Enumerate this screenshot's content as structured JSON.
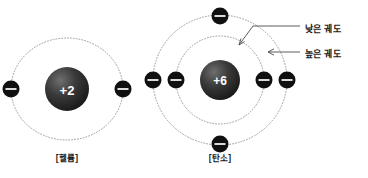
{
  "figure": {
    "background_color": "#ffffff",
    "orbit_color": "#9a9a9a",
    "electron_color": "#101010",
    "nucleus_color": "#2b2b2b",
    "text_color": "#1a1a1a"
  },
  "atoms": [
    {
      "id": "helium",
      "caption": "[헬륨]",
      "nucleus_label": "+2",
      "nucleus_cx": 67,
      "nucleus_cy": 89,
      "nucleus_r": 22,
      "shells": [
        {
          "name": "shell-1",
          "rx": 56,
          "ry": 51
        }
      ],
      "electrons": [
        {
          "cx": 11,
          "cy": 89
        },
        {
          "cx": 123,
          "cy": 89
        }
      ]
    },
    {
      "id": "carbon",
      "caption": "[탄소]",
      "nucleus_label": "+6",
      "nucleus_cx": 220,
      "nucleus_cy": 80,
      "nucleus_r": 20,
      "shells": [
        {
          "name": "inner-shell",
          "rx": 44,
          "ry": 44
        },
        {
          "name": "outer-shell",
          "rx": 67,
          "ry": 65
        }
      ],
      "electrons": [
        {
          "cx": 176,
          "cy": 80
        },
        {
          "cx": 264,
          "cy": 80
        },
        {
          "cx": 153,
          "cy": 80
        },
        {
          "cx": 287,
          "cy": 80
        },
        {
          "cx": 220,
          "cy": 16
        },
        {
          "cx": 220,
          "cy": 144
        }
      ]
    }
  ],
  "annotations": [
    {
      "id": "low-orbit",
      "label": "낮은 궤도"
    },
    {
      "id": "high-orbit",
      "label": "높은 궤도"
    }
  ]
}
